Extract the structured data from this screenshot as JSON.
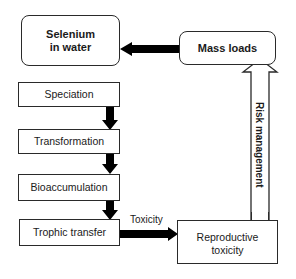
{
  "nodes": {
    "selenium": "Selenium\nin water",
    "selenium_line1": "Selenium",
    "selenium_line2": "in water",
    "mass_loads": "Mass loads",
    "speciation": "Speciation",
    "transformation": "Transformation",
    "bioaccumulation": "Bioaccumulation",
    "trophic_transfer": "Trophic transfer",
    "reproductive_line1": "Reproductive",
    "reproductive_line2": "toxicity"
  },
  "edges": {
    "toxicity_label": "Toxicity",
    "risk_label": "Risk management"
  },
  "colors": {
    "stroke": "#2a2a2a",
    "arrow_fill": "#000000",
    "background": "#ffffff"
  }
}
